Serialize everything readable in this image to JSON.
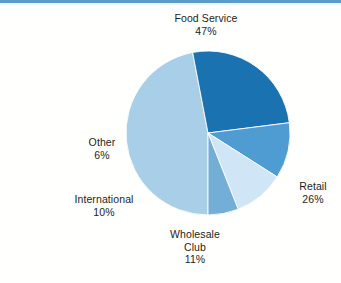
{
  "figure": {
    "type": "pie-chart-figure",
    "background_color": "#fffffe",
    "rule_color": "#5b9bc8"
  },
  "chart_data": {
    "type": "pie",
    "title": "",
    "subtitle": "",
    "xlabel": "",
    "ylabel": "",
    "legend_position": "none",
    "grid": false,
    "labels_shown": "category name and percent placed outside each slice",
    "unit": "percent",
    "total": 100,
    "categories": [
      "Food Service",
      "Retail",
      "Wholesale Club",
      "International",
      "Other"
    ],
    "values": [
      47,
      26,
      11,
      10,
      6
    ],
    "value_labels": [
      "47%",
      "26%",
      "11%",
      "10%",
      "6%"
    ],
    "colors": [
      "#a9cfe8",
      "#1b72b0",
      "#4e9cd1",
      "#d0e5f6",
      "#72aed5"
    ],
    "slices": [
      {
        "name": "Food Service",
        "label_line1": "Food Service",
        "label_line2": "",
        "percent_label": "47%",
        "value": 47,
        "color": "#a9cfe8",
        "start_angle_deg": 180,
        "end_angle_deg": 349.2
      },
      {
        "name": "Retail",
        "label_line1": "Retail",
        "label_line2": "",
        "percent_label": "26%",
        "value": 26,
        "color": "#1b72b0",
        "start_angle_deg": 349.2,
        "end_angle_deg": 82.8
      },
      {
        "name": "Wholesale Club",
        "label_line1": "Wholesale",
        "label_line2": "Club",
        "percent_label": "11%",
        "value": 11,
        "color": "#4e9cd1",
        "start_angle_deg": 82.8,
        "end_angle_deg": 122.4
      },
      {
        "name": "International",
        "label_line1": "International",
        "label_line2": "",
        "percent_label": "10%",
        "value": 10,
        "color": "#d0e5f6",
        "start_angle_deg": 122.4,
        "end_angle_deg": 158.4
      },
      {
        "name": "Other",
        "label_line1": "Other",
        "label_line2": "",
        "percent_label": "6%",
        "value": 6,
        "color": "#72aed5",
        "start_angle_deg": 158.4,
        "end_angle_deg": 180
      }
    ],
    "geometry": {
      "center_x": 208,
      "center_y": 133,
      "radius": 82
    }
  }
}
